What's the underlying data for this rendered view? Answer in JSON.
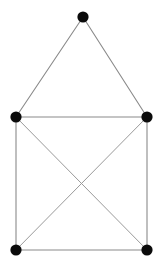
{
  "figure": {
    "background_color": "#ffffff",
    "width": 161,
    "height": 266
  },
  "style": {
    "node_color": "#0b0b0b",
    "node_radius": 5.6,
    "edge_color": "#8a8a8a",
    "edge_color_diagonal": "#9a9a9a",
    "edge_width": 1.1
  },
  "chart_data": {
    "type": "diagram",
    "title": "",
    "xlabel": "",
    "ylabel": "",
    "node_count": 5,
    "edge_count": 8,
    "nodes": [
      {
        "id": "apex",
        "label": "",
        "x": 83,
        "y": 17,
        "degree": 2
      },
      {
        "id": "left-middle",
        "label": "",
        "x": 16,
        "y": 117,
        "degree": 4
      },
      {
        "id": "right-middle",
        "label": "",
        "x": 147,
        "y": 117,
        "degree": 4
      },
      {
        "id": "bottom-left",
        "label": "",
        "x": 16,
        "y": 250,
        "degree": 3
      },
      {
        "id": "bottom-right",
        "label": "",
        "x": 147,
        "y": 250,
        "degree": 3
      }
    ],
    "edges": [
      {
        "id": "apex-to-left-middle",
        "from": "apex",
        "to": "left-middle",
        "kind": "roof"
      },
      {
        "id": "apex-to-right-middle",
        "from": "apex",
        "to": "right-middle",
        "kind": "roof"
      },
      {
        "id": "left-middle-to-right-middle",
        "from": "left-middle",
        "to": "right-middle",
        "kind": "horizontal"
      },
      {
        "id": "left-middle-to-bottom-left",
        "from": "left-middle",
        "to": "bottom-left",
        "kind": "vertical"
      },
      {
        "id": "right-middle-to-bottom-right",
        "from": "right-middle",
        "to": "bottom-right",
        "kind": "vertical"
      },
      {
        "id": "bottom-left-to-bottom-right",
        "from": "bottom-left",
        "to": "bottom-right",
        "kind": "horizontal"
      },
      {
        "id": "left-middle-to-bottom-right",
        "from": "left-middle",
        "to": "bottom-right",
        "kind": "diagonal"
      },
      {
        "id": "right-middle-to-bottom-left",
        "from": "right-middle",
        "to": "bottom-left",
        "kind": "diagonal"
      }
    ],
    "crossing_point": {
      "x": 82,
      "y": 183
    }
  }
}
